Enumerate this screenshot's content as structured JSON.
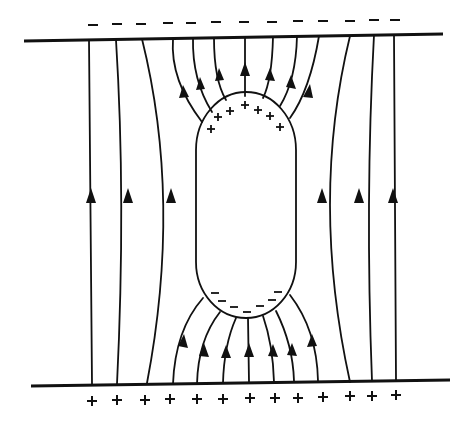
{
  "diagram": {
    "top_plate": {
      "charge_symbol": "–",
      "count": 13
    },
    "bottom_plate": {
      "charge_symbol": "+",
      "count": 13
    },
    "conductor": {
      "shape": "capsule",
      "top_charge_symbol": "+",
      "top_charge_count": 9,
      "bottom_charge_symbol": "–",
      "bottom_charge_count": 9
    },
    "field_lines": {
      "count": 13,
      "direction": "upward",
      "color": "#111111"
    }
  }
}
